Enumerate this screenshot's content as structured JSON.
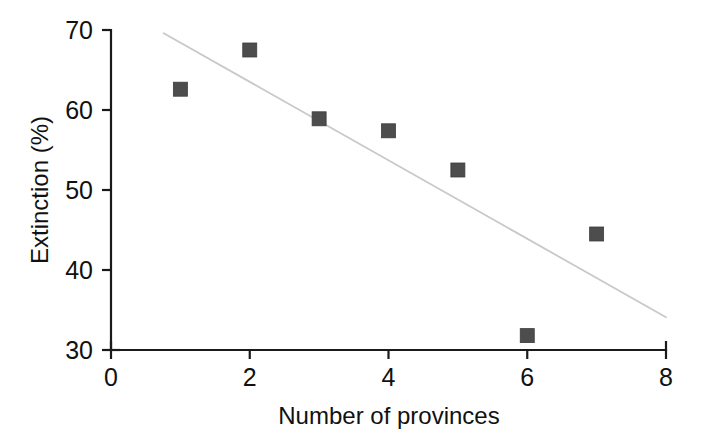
{
  "chart_data": {
    "type": "scatter",
    "title": "",
    "xlabel": "Number of provinces",
    "ylabel": "Extinction (%)",
    "xlim": [
      0,
      8
    ],
    "ylim": [
      30,
      70
    ],
    "xticks": [
      0,
      2,
      4,
      6,
      8
    ],
    "yticks": [
      30,
      40,
      50,
      60,
      70
    ],
    "xtick_labels": [
      "0",
      "2",
      "4",
      "6",
      "8"
    ],
    "ytick_labels": [
      "30",
      "40",
      "50",
      "60",
      "70"
    ],
    "grid": false,
    "legend": null,
    "marker_style": "filled-square",
    "marker_color": "#4d4d4d",
    "trendline_color": "#c9c9c9",
    "axis_color": "#1a1a1a",
    "background_color": "#ffffff",
    "series": [
      {
        "name": "Extinction vs provinces",
        "x": [
          1,
          2,
          3,
          4,
          5,
          6,
          7
        ],
        "y": [
          62.6,
          67.5,
          58.9,
          57.4,
          52.5,
          31.8,
          44.5
        ],
        "points": [
          {
            "x": 1,
            "y": 62.6
          },
          {
            "x": 2,
            "y": 67.5
          },
          {
            "x": 3,
            "y": 58.9
          },
          {
            "x": 4,
            "y": 57.4
          },
          {
            "x": 5,
            "y": 52.5
          },
          {
            "x": 6,
            "y": 31.8
          },
          {
            "x": 7,
            "y": 44.5
          }
        ]
      }
    ],
    "trendline": {
      "name": "linear fit",
      "x_start": 0.76,
      "y_start": 69.6,
      "x_end": 8.0,
      "y_end": 34.1
    }
  }
}
